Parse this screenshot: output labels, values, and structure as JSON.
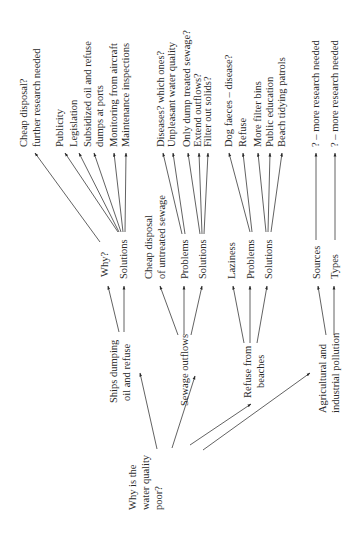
{
  "diagram": {
    "orientation": "rotated-90-ccw",
    "root": {
      "label": [
        "Why is the",
        "water quality",
        "poor?"
      ]
    },
    "branches": [
      {
        "label": [
          "Ships dumping",
          "oil and refuse"
        ],
        "children": [
          {
            "label": [
              "Why?"
            ],
            "leaves": [
              [
                "Cheap disposal?",
                "further research needed"
              ]
            ]
          },
          {
            "label": [
              "Solutions"
            ],
            "leaves": [
              [
                "Publicity"
              ],
              [
                "Legislation"
              ],
              [
                "Subsidized oil and refuse",
                "dumps at ports"
              ],
              [
                "Monitoring from aircraft"
              ],
              [
                "Maintenance inspections"
              ]
            ]
          }
        ]
      },
      {
        "label": [
          "Sewage outflows"
        ],
        "children": [
          {
            "label": [
              "Cheap disposal",
              "of untreated sewage"
            ],
            "leaves": []
          },
          {
            "label": [
              "Problems"
            ],
            "leaves": [
              [
                "Diseases? which ones?"
              ],
              [
                "Unpleasant water quality"
              ]
            ]
          },
          {
            "label": [
              "Solutions"
            ],
            "leaves": [
              [
                "Only dump treated sewage?"
              ],
              [
                "Extend outflows?"
              ],
              [
                "Filter out solids?"
              ]
            ]
          }
        ]
      },
      {
        "label": [
          "Refuse from",
          "beaches"
        ],
        "children": [
          {
            "label": [
              "Laziness"
            ],
            "leaves": []
          },
          {
            "label": [
              "Problems"
            ],
            "leaves": [
              [
                "Dog faeces – disease?"
              ],
              [
                "Refuse"
              ]
            ]
          },
          {
            "label": [
              "Solutions"
            ],
            "leaves": [
              [
                "More filter bins"
              ],
              [
                "Public education"
              ],
              [
                "Beach tidying patrols"
              ]
            ]
          }
        ]
      },
      {
        "label": [
          "Agricultural and",
          "industrial pollution"
        ],
        "children": [
          {
            "label": [
              "Sources"
            ],
            "leaves": [
              [
                "? – more research needed"
              ]
            ]
          },
          {
            "label": [
              "Types"
            ],
            "leaves": [
              [
                "? – more research needed"
              ]
            ]
          }
        ]
      }
    ]
  },
  "colors": {
    "text": "#2a2a2a",
    "line": "#3a3a3a",
    "background": "#ffffff"
  }
}
